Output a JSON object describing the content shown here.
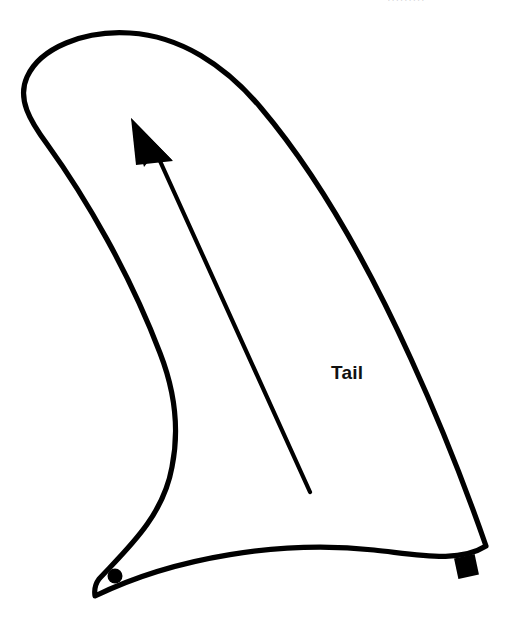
{
  "canvas": {
    "width": 516,
    "height": 639,
    "background_color": "#ffffff"
  },
  "diagram": {
    "stroke_color": "#000000",
    "fill_color": "#ffffff",
    "stroke_width": 5
  },
  "labels": {
    "tail": "Tail"
  },
  "watermark": {
    "text": "· · · · · · · · ·",
    "color": "#b9b9bd"
  },
  "arrow": {
    "color": "#000000",
    "tail_x": 310,
    "tail_y": 492,
    "head_x": 140,
    "head_y": 125,
    "line_width": 4
  },
  "markers": [
    {
      "name": "circle-marker",
      "shape": "circle",
      "x": 115,
      "y": 576,
      "radius": 7,
      "color": "#000000"
    },
    {
      "name": "square-marker",
      "shape": "square",
      "x": 467,
      "y": 566,
      "size": 21,
      "rotation": -12,
      "color": "#000000"
    }
  ],
  "chart_data": {
    "type": "line",
    "xlabel": "",
    "ylabel": "",
    "outline_path": "M 130,33 C 84,30 40,48 27,76 C 18,96 28,118 44,140 C 82,193 128,270 160,352 C 175,392 178,430 172,465 C 163,515 128,548 99,578 C 96,582 94,589 95,595 L 485,545 C 470,500 445,432 412,360 C 372,272 322,180 262,108 C 226,65 180,36 130,33 Z",
    "bottom_path": "M 95,595 C 175,556 280,540 372,549 C 420,554 458,562 485,545"
  }
}
